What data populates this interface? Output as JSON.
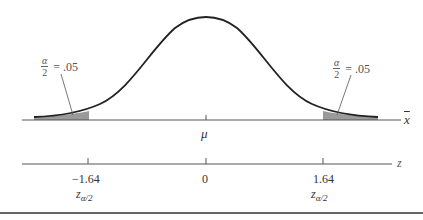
{
  "figure": {
    "type": "normal-distribution-two-tailed",
    "colors": {
      "curve": "#222222",
      "axis": "#555555",
      "shade": "#9a9a9a",
      "leader": "#555555",
      "rule": "#333333"
    },
    "x_axis": {
      "label": "x",
      "center_label": "μ"
    },
    "z_axis": {
      "label": "z",
      "ticks": [
        {
          "value": "−1.64",
          "sub_label_main": "z",
          "sub_label_sub": "α/2"
        },
        {
          "value": "0"
        },
        {
          "value": "1.64",
          "sub_label_main": "z",
          "sub_label_sub": "α/2"
        }
      ]
    },
    "tails": {
      "left": {
        "num": "α",
        "den": "2",
        "eq": "= .05"
      },
      "right": {
        "num": "α",
        "den": "2",
        "eq": "= .05"
      }
    }
  }
}
